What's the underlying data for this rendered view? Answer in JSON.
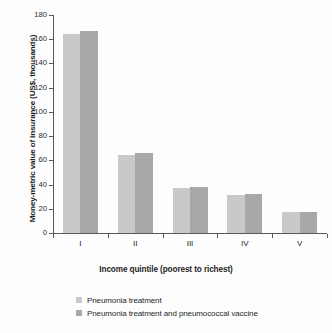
{
  "chart_data": {
    "type": "bar",
    "title": "",
    "subtitle": "",
    "xlabel": "Income quintile (poorest to richest)",
    "ylabel": "Money-metric value of insurance (US$, thousands)",
    "categories": [
      "I",
      "II",
      "III",
      "IV",
      "V"
    ],
    "series": [
      {
        "name": "Pneumonia treatment",
        "color": "#c9c9c9",
        "values": [
          164,
          64.5,
          37.5,
          31.5,
          17
        ]
      },
      {
        "name": "Pneumonia treatment and pneumococcal vaccine",
        "color": "#a8a8a8",
        "values": [
          167,
          66,
          38,
          32,
          17.5
        ]
      }
    ],
    "ylim": [
      0,
      180
    ],
    "yticks": [
      0,
      20,
      40,
      60,
      80,
      100,
      120,
      140,
      160,
      180
    ],
    "ytick_labels": [
      "0",
      "20",
      "40",
      "60",
      "80",
      "100",
      "120",
      "140",
      "160",
      "180"
    ],
    "grid": false,
    "legend_position": "bottom-left",
    "axis_color": "#5a5a5a"
  }
}
